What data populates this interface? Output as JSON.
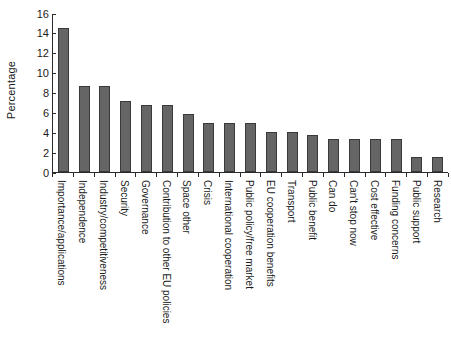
{
  "chart_data": {
    "type": "bar",
    "title": "",
    "subtitle": "",
    "xlabel": "",
    "ylabel": "Percentage",
    "ylim": [
      0,
      16
    ],
    "yticks": [
      0,
      2,
      4,
      6,
      8,
      10,
      12,
      14,
      16
    ],
    "grid": false,
    "legend": null,
    "orientation": "vertical",
    "bar_color": "#656565",
    "bar_edge_color": "#3a3a3a",
    "axis_color": "#2b2b2b",
    "categories": [
      "Importance/applications",
      "Independence",
      "Industry/competitiveness",
      "Security",
      "Governance",
      "Contribution to other EU policies",
      "Space other",
      "Crisis",
      "International cooperation",
      "Public policy/free market",
      "EU cooperation benefits",
      "Transport",
      "Public benefit",
      "Can do",
      "Can't stop now",
      "Cost effective",
      "Funding concerns",
      "Public support",
      "Research"
    ],
    "values": [
      14.6,
      8.7,
      8.7,
      7.2,
      6.8,
      6.8,
      5.9,
      5.0,
      5.0,
      5.0,
      4.1,
      4.1,
      3.7,
      3.3,
      3.3,
      3.3,
      3.3,
      1.5,
      1.5
    ]
  }
}
